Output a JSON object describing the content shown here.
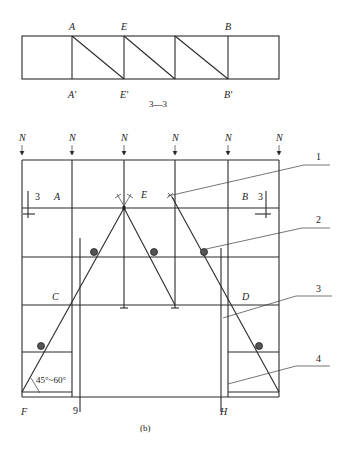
{
  "top_view": {
    "labels_top": [
      "A",
      "E",
      "B"
    ],
    "labels_bottom": [
      "A'",
      "E'",
      "B'"
    ],
    "caption": "3—3"
  },
  "main_view": {
    "load_label": "N",
    "load_count": 6,
    "points": {
      "A": "A",
      "E": "E",
      "B": "B",
      "C": "C",
      "D": "D",
      "F": "F",
      "G": "9",
      "H": "H"
    },
    "section_marks": [
      "3",
      "3"
    ],
    "callouts": [
      "1",
      "2",
      "3",
      "4"
    ],
    "angle_label": "45°~60°",
    "caption": "(b)"
  }
}
